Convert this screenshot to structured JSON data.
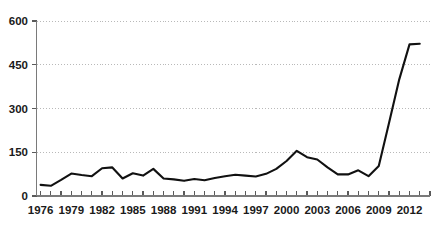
{
  "chart_data": {
    "type": "line",
    "title": "",
    "subtitle": "",
    "xlabel": "",
    "ylabel": "",
    "xlim": [
      1975.6,
      2014.0
    ],
    "ylim": [
      0,
      600
    ],
    "grid": true,
    "legend": false,
    "legend_position": "none",
    "line_color": "#111111",
    "grid_color": "#b9b9b9",
    "axis_color": "#7a7a7a",
    "y_ticks": [
      0,
      150,
      300,
      450,
      600
    ],
    "y_tick_labels": [
      "0",
      "150",
      "300",
      "450",
      "600"
    ],
    "x_ticks": [
      1976,
      1977,
      1978,
      1979,
      1980,
      1981,
      1982,
      1983,
      1984,
      1985,
      1986,
      1987,
      1988,
      1989,
      1990,
      1991,
      1992,
      1993,
      1994,
      1995,
      1996,
      1997,
      1998,
      1999,
      2000,
      2001,
      2002,
      2003,
      2004,
      2005,
      2006,
      2007,
      2008,
      2009,
      2010,
      2011,
      2012,
      2013,
      2014
    ],
    "x_tick_labels": [
      "1976",
      "1979",
      "1982",
      "1985",
      "1988",
      "1991",
      "1994",
      "1997",
      "2000",
      "2003",
      "2006",
      "2009",
      "2012"
    ],
    "x_tick_label_years": [
      1976,
      1979,
      1982,
      1985,
      1988,
      1991,
      1994,
      1997,
      2000,
      2003,
      2006,
      2009,
      2012
    ],
    "series": [
      {
        "name": "series-1",
        "x": [
          1976,
          1977,
          1978,
          1979,
          1980,
          1981,
          1982,
          1983,
          1984,
          1985,
          1986,
          1987,
          1988,
          1989,
          1990,
          1991,
          1992,
          1993,
          1994,
          1995,
          1996,
          1997,
          1998,
          1999,
          2000,
          2001,
          2002,
          2003,
          2004,
          2005,
          2006,
          2007,
          2008,
          2009,
          2010,
          2011,
          2012,
          2013
        ],
        "values": [
          38,
          35,
          55,
          77,
          72,
          68,
          95,
          98,
          60,
          78,
          70,
          93,
          60,
          57,
          52,
          58,
          54,
          62,
          68,
          73,
          70,
          67,
          76,
          93,
          120,
          155,
          133,
          125,
          98,
          74,
          74,
          88,
          68,
          103,
          250,
          400,
          520,
          522
        ]
      }
    ]
  }
}
